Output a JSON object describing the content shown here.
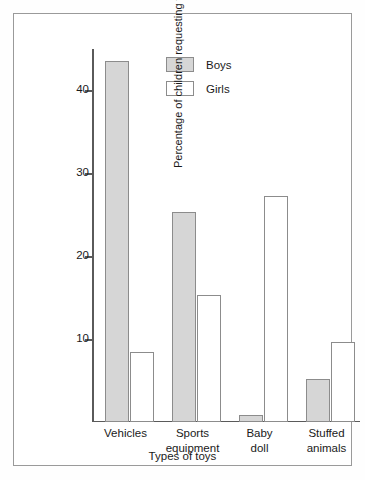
{
  "chart_data": {
    "type": "bar",
    "title": "",
    "subtitle": "",
    "xlabel": "Types of toys",
    "ylabel": "Percentage of children requesting toys in each category",
    "categories": [
      "Vehicles",
      "Sports equipment",
      "Baby doll",
      "Stuffed animals"
    ],
    "category_lines": [
      [
        "Vehicles"
      ],
      [
        "Sports",
        "equipment"
      ],
      [
        "Baby",
        "doll"
      ],
      [
        "Stuffed",
        "animals"
      ]
    ],
    "series": [
      {
        "name": "Boys",
        "color": "#d6d6d6",
        "values": [
          43.5,
          25.3,
          0.8,
          5.2
        ]
      },
      {
        "name": "Girls",
        "color": "#ffffff",
        "values": [
          8.4,
          15.3,
          27.3,
          9.7
        ]
      }
    ],
    "ylim": [
      0,
      45
    ],
    "yticks": [
      10,
      20,
      30,
      40
    ],
    "ytick_labels": [
      "10",
      "20",
      "30",
      "40"
    ],
    "grid": false,
    "legend_position": "upper-center",
    "axis_color": "#5a5a5a",
    "bar_edge_color": "#8c8c8c",
    "frame_color": "#9a9a9a"
  },
  "legend": {
    "entries": [
      {
        "label": "Boys",
        "style": "filled"
      },
      {
        "label": "Girls",
        "style": "outlined"
      }
    ]
  },
  "axes": {
    "x_title": "Types of toys",
    "y_title": "Percentage of children requesting toys in each category"
  }
}
